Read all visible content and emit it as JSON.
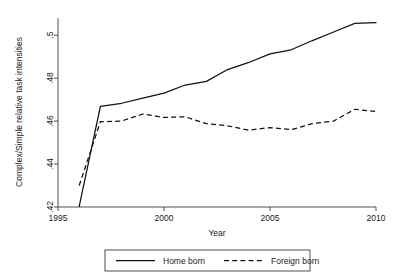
{
  "chart_data": {
    "type": "line",
    "title": "",
    "xlabel": "Year",
    "ylabel": "Complex/Simple relative task intensities",
    "xlim": [
      1995,
      2010
    ],
    "ylim": [
      0.42,
      0.508
    ],
    "grid": false,
    "legend_position": "bottom",
    "xticks": [
      1995,
      2000,
      2005,
      2010
    ],
    "xtick_labels": [
      "1995",
      "2000",
      "2005",
      "2010"
    ],
    "yticks": [
      0.42,
      0.44,
      0.46,
      0.48,
      0.5
    ],
    "ytick_labels": [
      ".42",
      ".44",
      ".46",
      ".48",
      ".5"
    ],
    "x": [
      1996,
      1997,
      1998,
      1999,
      2000,
      2001,
      2002,
      2003,
      2004,
      2005,
      2006,
      2007,
      2008,
      2009,
      2010
    ],
    "series": [
      {
        "name": "Home born",
        "style": "solid",
        "values": [
          0.4203,
          0.4668,
          0.4683,
          0.4707,
          0.473,
          0.4768,
          0.4785,
          0.484,
          0.4873,
          0.4913,
          0.4932,
          0.4975,
          0.5015,
          0.5055,
          0.5058
        ]
      },
      {
        "name": "Foreign born",
        "style": "dashed",
        "values": [
          0.43,
          0.4597,
          0.46,
          0.4633,
          0.4617,
          0.462,
          0.4588,
          0.4578,
          0.4558,
          0.457,
          0.456,
          0.4588,
          0.46,
          0.4655,
          0.4645
        ]
      }
    ]
  },
  "legend": {
    "entries": [
      {
        "label": "Home born",
        "style": "solid"
      },
      {
        "label": "Foreign born",
        "style": "dashed"
      }
    ]
  }
}
